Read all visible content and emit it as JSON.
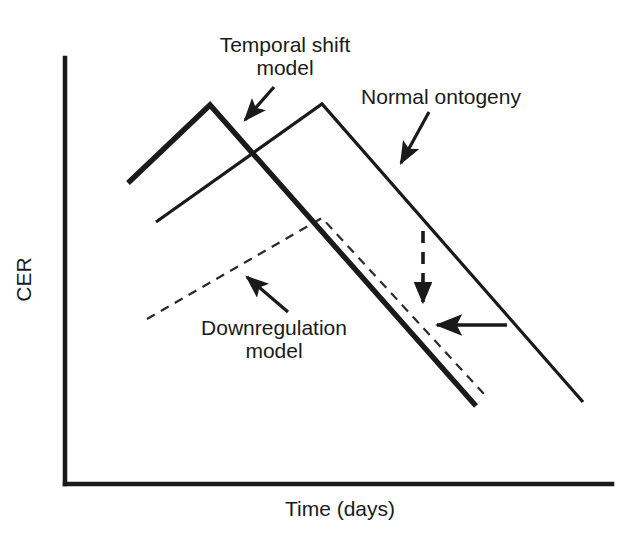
{
  "figure": {
    "kind": "schematic-line-diagram",
    "background_color": "#ffffff",
    "ink_color": "#1a1a1a"
  },
  "axes": {
    "y_label": "CER",
    "x_label": "Time (days)",
    "x_tick_labels": [],
    "y_tick_labels": [],
    "grid": "off",
    "origin_px": [
      65,
      484
    ],
    "x_axis_end_px": [
      612,
      484
    ],
    "y_axis_top_px": [
      65,
      58
    ]
  },
  "annotations": [
    {
      "name": "temporal-shift-model",
      "lines": [
        "Temporal shift",
        "model"
      ],
      "text_x": 285,
      "text_y": 40,
      "arrow_from": [
        274,
        87
      ],
      "arrow_to": [
        239,
        127
      ]
    },
    {
      "name": "normal-ontogeny",
      "lines": [
        "Normal ontogeny"
      ],
      "text_x": 441,
      "text_y": 92,
      "arrow_from": [
        429,
        112
      ],
      "arrow_to": [
        396,
        171
      ]
    },
    {
      "name": "downregulation-model",
      "lines": [
        "Downregulation",
        "model"
      ],
      "text_x": 274,
      "text_y": 323,
      "arrow_from": [
        288,
        312
      ],
      "arrow_to": [
        241,
        272
      ]
    }
  ],
  "chart_data": {
    "type": "line",
    "title": "",
    "xlabel": "Time (days)",
    "ylabel": "CER",
    "xlim": [
      0,
      100
    ],
    "ylim": [
      0,
      100
    ],
    "grid": false,
    "legend": "annotated-callouts",
    "axis_ticks": "none",
    "series": [
      {
        "name": "Temporal shift model",
        "style": "thick-solid",
        "stroke_width": 5,
        "dash": "none",
        "points_px": [
          [
            128,
            183
          ],
          [
            210,
            105
          ],
          [
            476,
            406
          ]
        ],
        "points_data": [
          [
            11.5,
            66.5
          ],
          [
            26.5,
            85.0
          ],
          [
            75.1,
            14.5
          ]
        ],
        "description": "Earlier, higher peak; declines steeply and ends lowest."
      },
      {
        "name": "Normal ontogeny",
        "style": "thin-solid",
        "stroke_width": 3,
        "dash": "none",
        "points_px": [
          [
            156,
            222
          ],
          [
            322,
            104
          ],
          [
            583,
            402
          ]
        ],
        "points_data": [
          [
            16.6,
            57.4
          ],
          [
            47.0,
            85.2
          ],
          [
            94.7,
            15.4
          ]
        ],
        "description": "Later peak of same height; declines to the right of the others."
      },
      {
        "name": "Downregulation model",
        "style": "thin-dashed",
        "stroke_width": 2,
        "dash": "9 7",
        "points_px": [
          [
            147,
            319
          ],
          [
            322,
            218
          ],
          [
            484,
            394
          ]
        ],
        "points_data": [
          [
            15.0,
            39.1
          ],
          [
            47.0,
            62.9
          ],
          [
            76.6,
            16.6
          ]
        ],
        "description": "Same timing as normal ontogeny but a much lower, damped peak."
      }
    ],
    "marker_arrows": [
      {
        "name": "vertical-offset-arrow",
        "style": "dashed",
        "direction": "down",
        "from_px": [
          423,
          231
        ],
        "to_px": [
          423,
          312
        ],
        "meaning": "vertical (magnitude) difference from normal ontogeny"
      },
      {
        "name": "horizontal-pointer-arrow",
        "style": "solid",
        "direction": "left",
        "from_px": [
          507,
          325
        ],
        "to_px": [
          428,
          325
        ],
        "meaning": "points at the convergence of the model curves"
      }
    ]
  }
}
